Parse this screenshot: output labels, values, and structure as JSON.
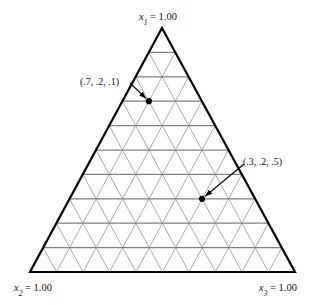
{
  "figure": {
    "type": "ternary-simplex-grid",
    "background_color": "#ffffff",
    "border_color": "#000000",
    "grid_horizontal_color": "#808080",
    "grid_diagonal_color": "#9a9a9a",
    "point_color": "#000000"
  },
  "vertices": {
    "top": {
      "var": "x",
      "sub": "1",
      "eq": " = 1.00",
      "full": "x1 = 1.00"
    },
    "bottom_left": {
      "var": "x",
      "sub": "2",
      "eq": " = 1.00",
      "full": "x2 = 1.00"
    },
    "bottom_right": {
      "var": "x",
      "sub": "3",
      "eq": " = 1.00",
      "full": "x3 = 1.00"
    }
  },
  "chart_data": {
    "type": "scatter",
    "title": "",
    "xlabel": "",
    "ylabel": "",
    "coordinate_system": "ternary",
    "axes": [
      "x1",
      "x2",
      "x3"
    ],
    "axis_labels": [
      "x1 = 1.00",
      "x2 = 1.00",
      "x3 = 1.00"
    ],
    "grid": true,
    "grid_divisions": 10,
    "axis_range": [
      0,
      1
    ],
    "legend_position": "none",
    "points": [
      {
        "label": "(.7, .2, .1)",
        "x1": 0.7,
        "x2": 0.2,
        "x3": 0.1
      },
      {
        "label": "(.3, .2, .5)",
        "x1": 0.3,
        "x2": 0.2,
        "x3": 0.5
      }
    ]
  }
}
